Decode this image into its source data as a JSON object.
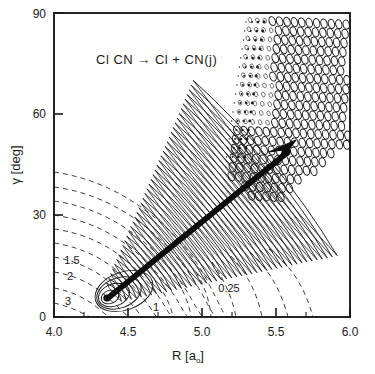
{
  "figure": {
    "reaction_label": "Cl CN → Cl + CN(j)",
    "background_color": "#ffffff",
    "line_color": "#1a1a1a"
  },
  "axes": {
    "x": {
      "label_main": "R  [a",
      "label_sub": "o",
      "label_close": "]",
      "min": 4.0,
      "max": 6.0,
      "ticks": [
        "4.0",
        "4.5",
        "5.0",
        "5.5",
        "6.0"
      ],
      "tick_values": [
        4.0,
        4.5,
        5.0,
        5.5,
        6.0
      ],
      "minor_tick_values": [
        4.1,
        4.2,
        4.3,
        4.4,
        4.6,
        4.7,
        4.8,
        4.9,
        5.1,
        5.2,
        5.3,
        5.4,
        5.6,
        5.7,
        5.8,
        5.9
      ]
    },
    "y": {
      "label_main": "γ  [deg]",
      "min": 0,
      "max": 90,
      "ticks": [
        "0",
        "30",
        "60",
        "90"
      ],
      "tick_values": [
        0,
        30,
        60,
        90
      ]
    }
  },
  "chart_data": {
    "type": "contour",
    "title": "Cl CN → Cl + CN(j)",
    "xlabel": "R [a₀]",
    "ylabel": "γ [deg]",
    "xlim": [
      4.0,
      6.0
    ],
    "ylim": [
      0,
      90
    ],
    "grid": false,
    "legend": "none",
    "contour_levels": [
      {
        "label": "0.25",
        "style": "dashed",
        "label_x": 5.22,
        "label_y": 10.5
      },
      {
        "label": "1",
        "style": "dashed",
        "label_x": 4.73,
        "label_y": 5.0
      },
      {
        "label": "1.5",
        "style": "dashed",
        "label_x": 4.2,
        "label_y": 14.0
      },
      {
        "label": "2",
        "style": "dashed",
        "label_x": 4.2,
        "label_y": 11.5
      },
      {
        "label": "3",
        "style": "dashed",
        "label_x": 4.17,
        "label_y": 5.5
      }
    ],
    "wavepacket": {
      "description": "oscillatory nodal structure: nested ellipses near origin, dense fringes along diagonal band, ellipse lattice in upper right",
      "origin": {
        "x": 4.36,
        "y": 7.5
      }
    },
    "arrow": {
      "description": "reaction path arrow",
      "start": {
        "x": 4.36,
        "y": 7.5
      },
      "end": {
        "x": 5.63,
        "y": 54.0
      }
    }
  }
}
